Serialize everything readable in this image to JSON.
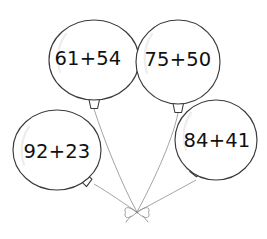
{
  "worksheet": {
    "title": "Balloon addition problems",
    "background_color": "#ffffff",
    "outline_color": "#3a3a3a",
    "string_color": "#8d8d8d",
    "text_color": "#111111",
    "sheen_color": "#ededed"
  },
  "bow": {
    "label": "bow-knot",
    "x": 137,
    "y": 213
  },
  "balloons": [
    {
      "id": "balloon-1",
      "expression": "61+54",
      "first_addend": 61,
      "second_addend": 54,
      "operator": "+",
      "label_x": 88,
      "label_y": 59
    },
    {
      "id": "balloon-2",
      "expression": "75+50",
      "first_addend": 75,
      "second_addend": 50,
      "operator": "+",
      "label_x": 178,
      "label_y": 60
    },
    {
      "id": "balloon-3",
      "expression": "92+23",
      "first_addend": 92,
      "second_addend": 23,
      "operator": "+",
      "label_x": 57,
      "label_y": 152
    },
    {
      "id": "balloon-4",
      "expression": "84+41",
      "first_addend": 84,
      "second_addend": 41,
      "operator": "+",
      "label_x": 217,
      "label_y": 141
    }
  ]
}
